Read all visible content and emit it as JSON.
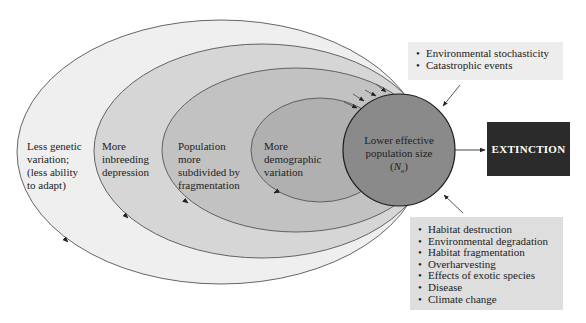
{
  "diagram": {
    "type": "extinction-vortex",
    "rings": [
      {
        "id": "outer",
        "label": "Less genetic variation; (less ability to adapt)",
        "lines": [
          "Less genetic",
          "variation;",
          "(less ability",
          "to adapt)"
        ],
        "fill": "#efefef"
      },
      {
        "id": "second",
        "label": "More inbreeding depression",
        "lines": [
          "More",
          "inbreeding",
          "depression"
        ],
        "fill": "#d6d6d6"
      },
      {
        "id": "third",
        "label": "Population more subdivided by fragmentation",
        "lines": [
          "Population",
          "more",
          "subdivided by",
          "fragmentation"
        ],
        "fill": "#c2c2c2"
      },
      {
        "id": "inner",
        "label": "More demographic variation",
        "lines": [
          "More",
          "demographic",
          "variation"
        ],
        "fill": "#b0b0b0"
      }
    ],
    "center": {
      "line1": "Lower effective",
      "line2": "population size",
      "symbol": "N",
      "subscript": "e",
      "fill": "#8a8a8a"
    },
    "outcome": {
      "label": "EXTINCTION",
      "fill": "#2b2b2b",
      "text_color": "#ffffff"
    },
    "top_factors": {
      "items": [
        "Environmental stochasticity",
        "Catastrophic events"
      ]
    },
    "bottom_factors": {
      "items": [
        "Habitat destruction",
        "Environmental degradation",
        "Habitat fragmentation",
        "Overharvesting",
        "Effects of exotic species",
        "Disease",
        "Climate change"
      ]
    }
  }
}
